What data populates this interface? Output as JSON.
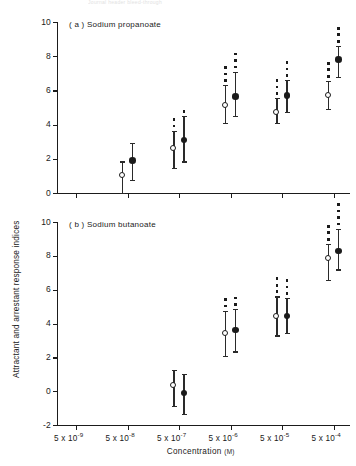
{
  "ghost_header": "Journal header bleed-through",
  "chart_data": {
    "type": "scatter",
    "title": "",
    "xlabel": "Concentration",
    "xlabel_unit": "(M)",
    "ylabel": "Attractant and arrestant response indices",
    "x_tick_labels": [
      "5 x 10-9",
      "5 x 10-8",
      "5 x 10-7",
      "5 x 10-6",
      "5 x 10-5",
      "5 x 10-4"
    ],
    "x_tick_mantissa": [
      "5 x 10",
      "5 x 10",
      "5 x 10",
      "5 x 10",
      "5 x 10",
      "5 x 10"
    ],
    "x_tick_exponent": [
      "-9",
      "-8",
      "-7",
      "-6",
      "-5",
      "-4"
    ],
    "grid": false,
    "legend_position": "none",
    "marker_types": [
      "open-circle",
      "filled-circle"
    ],
    "error_bar_type": "range",
    "significance_symbol": "*",
    "panels": [
      {
        "id": "a",
        "label": "( a ) Sodium propanoate",
        "ylim": [
          0,
          10
        ],
        "y_ticks": [
          0,
          2,
          4,
          6,
          8,
          10
        ],
        "y_tick_labels": [
          "0",
          "2",
          "4",
          "6",
          "8",
          "10"
        ],
        "series": [
          {
            "name": "attractant",
            "marker": "open-circle",
            "x": [
              "5 x 10-9",
              "5 x 10-8",
              "5 x 10-7",
              "5 x 10-6",
              "5 x 10-5",
              "5 x 10-4"
            ],
            "values": [
              null,
              1.0,
              2.6,
              5.1,
              4.65,
              5.7
            ],
            "err_low": [
              null,
              0.0,
              1.45,
              4.1,
              4.1,
              4.9
            ],
            "err_high": [
              null,
              1.85,
              3.65,
              6.3,
              5.55,
              6.55
            ],
            "stars": [
              0,
              0,
              2,
              3,
              3,
              3
            ]
          },
          {
            "name": "arrestant",
            "marker": "filled-circle",
            "x": [
              "5 x 10-9",
              "5 x 10-8",
              "5 x 10-7",
              "5 x 10-6",
              "5 x 10-5",
              "5 x 10-4"
            ],
            "values": [
              null,
              1.9,
              3.1,
              5.65,
              5.7,
              7.8
            ],
            "err_low": [
              null,
              0.75,
              1.85,
              4.5,
              4.75,
              6.8
            ],
            "err_high": [
              null,
              2.95,
              4.5,
              7.1,
              6.6,
              8.6
            ],
            "stars": [
              0,
              0,
              1,
              3,
              3,
              3
            ]
          }
        ]
      },
      {
        "id": "b",
        "label": "( b ) Sodium butanoate",
        "ylim": [
          -2,
          10
        ],
        "y_ticks": [
          -2,
          0,
          2,
          4,
          6,
          8,
          10
        ],
        "y_tick_labels": [
          "-2",
          "0",
          "2",
          "4",
          "6",
          "8",
          "10"
        ],
        "series": [
          {
            "name": "attractant",
            "marker": "open-circle",
            "x": [
              "5 x 10-9",
              "5 x 10-8",
              "5 x 10-7",
              "5 x 10-6",
              "5 x 10-5",
              "5 x 10-4"
            ],
            "values": [
              null,
              null,
              0.3,
              3.4,
              4.4,
              7.8
            ],
            "err_low": [
              null,
              null,
              -0.85,
              2.1,
              3.3,
              6.6
            ],
            "err_high": [
              null,
              null,
              1.25,
              4.75,
              5.6,
              8.7
            ],
            "stars": [
              0,
              0,
              0,
              2,
              3,
              3
            ]
          },
          {
            "name": "arrestant",
            "marker": "filled-circle",
            "x": [
              "5 x 10-9",
              "5 x 10-8",
              "5 x 10-7",
              "5 x 10-6",
              "5 x 10-5",
              "5 x 10-4"
            ],
            "values": [
              null,
              null,
              -0.1,
              3.6,
              4.45,
              8.3
            ],
            "err_low": [
              null,
              null,
              -1.35,
              2.35,
              3.45,
              7.2
            ],
            "err_high": [
              null,
              null,
              1.0,
              4.85,
              5.5,
              9.6
            ],
            "stars": [
              0,
              0,
              0,
              2,
              3,
              4
            ]
          }
        ]
      }
    ]
  }
}
